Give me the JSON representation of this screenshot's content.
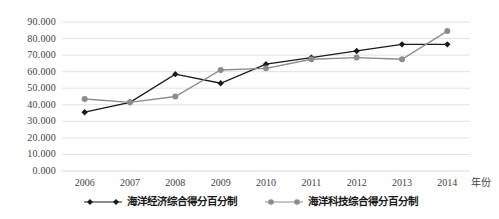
{
  "chart_data": {
    "type": "line",
    "title": "",
    "xlabel": "年份",
    "ylabel": "",
    "categories": [
      "2006",
      "2007",
      "2008",
      "2009",
      "2010",
      "2011",
      "2012",
      "2013",
      "2014"
    ],
    "x": [
      2006,
      2007,
      2008,
      2009,
      2010,
      2011,
      2012,
      2013,
      2014
    ],
    "ylim": [
      0,
      90
    ],
    "ytick_labels": [
      "90.000",
      "80.000",
      "70.000",
      "60.000",
      "50.000",
      "40.000",
      "30.000",
      "20.000",
      "10.000",
      "0.000"
    ],
    "ytick_values": [
      90,
      80,
      70,
      60,
      50,
      40,
      30,
      20,
      10,
      0
    ],
    "grid": true,
    "legend_position": "bottom",
    "series": [
      {
        "name": "海洋经济综合得分百分制",
        "marker": "diamond",
        "color": "#1a1a1a",
        "values": [
          35.5,
          41.5,
          58.5,
          53.0,
          64.5,
          68.5,
          72.5,
          76.5,
          76.5
        ]
      },
      {
        "name": "海洋科技综合得分百分制",
        "marker": "circle",
        "color": "#8c8c8c",
        "values": [
          43.5,
          41.5,
          45.0,
          61.0,
          62.0,
          67.5,
          68.5,
          67.5,
          84.5
        ]
      }
    ]
  },
  "axis": {
    "x_axis_title": "年份"
  },
  "colors": {
    "series_economy": "#1a1a1a",
    "series_technology": "#8c8c8c",
    "gridline": "#d9d9d9",
    "tick_text": "#3f3f3f",
    "background": "#ffffff"
  }
}
